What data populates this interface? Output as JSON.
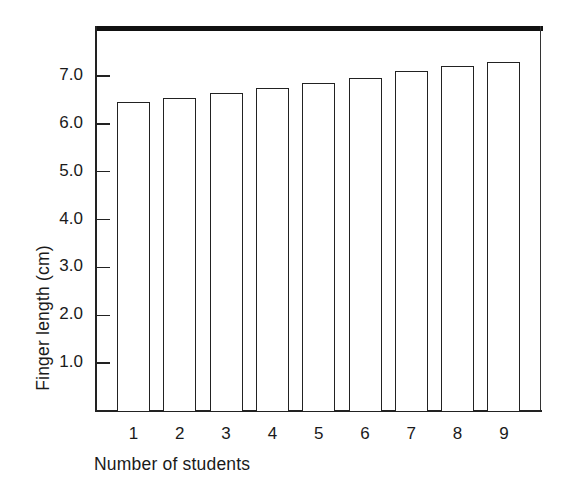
{
  "chart_data": {
    "type": "bar",
    "title": "",
    "xlabel": "Number of students",
    "ylabel": "Finger length (cm)",
    "categories": [
      "1",
      "2",
      "3",
      "4",
      "5",
      "6",
      "7",
      "8",
      "9"
    ],
    "values": [
      6.45,
      6.55,
      6.65,
      6.75,
      6.85,
      6.95,
      7.1,
      7.2,
      7.3
    ],
    "ylim": [
      0,
      8.0
    ],
    "yticks": [
      1.0,
      2.0,
      3.0,
      4.0,
      5.0,
      6.0,
      7.0
    ],
    "ytick_labels": [
      "1.0",
      "2.0",
      "3.0",
      "4.0",
      "5.0",
      "6.0",
      "7.0"
    ],
    "grid": false,
    "legend": null,
    "bar_fill": "#ffffff",
    "bar_edge": "#222222",
    "frame": "thick top rule, thin left/right/bottom axes"
  },
  "axes": {
    "x_title": "Number of students",
    "y_title": "Finger length (cm)"
  }
}
